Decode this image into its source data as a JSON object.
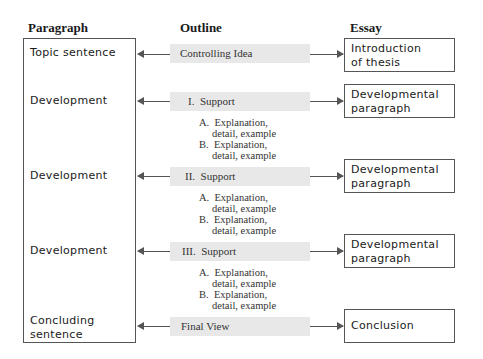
{
  "headers": {
    "paragraph": "Paragraph",
    "outline": "Outline",
    "essay": "Essay"
  },
  "paragraph_column": {
    "items": [
      "Topic sentence",
      "Development",
      "Development",
      "Development",
      "Concluding sentence"
    ],
    "concluding_line1": "Concluding",
    "concluding_line2": "sentence"
  },
  "outline_column": {
    "rows": [
      {
        "label": "Controlling Idea"
      },
      {
        "label": "I.  Support",
        "subs": [
          "A.  Explanation,",
          "detail, example",
          "B.  Explanation,",
          "detail, example"
        ]
      },
      {
        "label": "II.  Support",
        "subs": [
          "A.  Explanation,",
          "detail, example",
          "B.  Explanation,",
          "detail, example"
        ]
      },
      {
        "label": "III.  Support",
        "subs": [
          "A.  Explanation,",
          "detail, example",
          "B.  Explanation,",
          "detail, example"
        ]
      },
      {
        "label": "Final View"
      }
    ]
  },
  "essay_column": {
    "boxes": [
      {
        "line1": "Introduction",
        "line2": "of thesis"
      },
      {
        "line1": "Developmental",
        "line2": "paragraph"
      },
      {
        "line1": "Developmental",
        "line2": "paragraph"
      },
      {
        "line1": "Developmental",
        "line2": "paragraph"
      },
      {
        "line1": "Conclusion",
        "line2": ""
      }
    ]
  },
  "colors": {
    "band": "#e8e8e8",
    "line": "#555555",
    "text": "#1a1a1a"
  }
}
